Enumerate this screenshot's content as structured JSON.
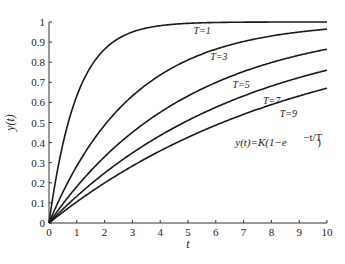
{
  "chart_data": {
    "type": "line",
    "title": "",
    "xlabel": "t",
    "ylabel": "y(t)",
    "xlim": [
      0,
      10
    ],
    "ylim": [
      0,
      1
    ],
    "xticks": [
      0,
      1,
      2,
      3,
      4,
      5,
      6,
      7,
      8,
      9,
      10
    ],
    "yticks": [
      0,
      0.1,
      0.2,
      0.3,
      0.4,
      0.5,
      0.6,
      0.7,
      0.8,
      0.9,
      1
    ],
    "ytick_labels": [
      "0",
      "0.1",
      "0.2",
      "0.3",
      "0.4",
      "0.5",
      "0.6",
      "0.7",
      "0.8",
      "0.9",
      "1"
    ],
    "xtick_labels": [
      "0",
      "1",
      "2",
      "3",
      "4",
      "5",
      "6",
      "7",
      "8",
      "9",
      "10"
    ],
    "grid": false,
    "formula": "y(t)=K(1−e^(−t/T))",
    "formula_parts": {
      "lhs": "y(t)=K(1−e",
      "exp": "−",
      "exp_num": "t",
      "exp_den": "T",
      "rhs": ")"
    },
    "K": 1,
    "series": [
      {
        "name": "T=1",
        "T": 1,
        "label": "T=1",
        "label_at": [
          5.2,
          0.94
        ]
      },
      {
        "name": "T=3",
        "T": 3,
        "label": "T=3",
        "label_at": [
          5.8,
          0.81
        ]
      },
      {
        "name": "T=5",
        "T": 5,
        "label": "T=5",
        "label_at": [
          6.6,
          0.67
        ]
      },
      {
        "name": "T=7",
        "T": 7,
        "label": "T=7",
        "label_at": [
          7.7,
          0.59
        ]
      },
      {
        "name": "T=9",
        "T": 9,
        "label": "T=9",
        "label_at": [
          8.3,
          0.525
        ]
      }
    ]
  }
}
